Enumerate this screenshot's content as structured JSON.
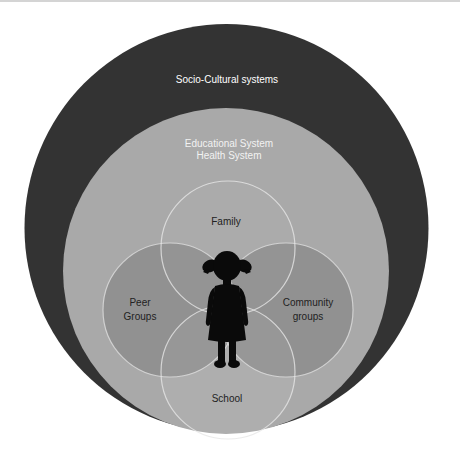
{
  "diagram": {
    "layers": {
      "outer": {
        "label": "Socio-Cultural systems",
        "color": "#333333",
        "text_color": "#ffffff"
      },
      "middle": {
        "line1": "Educational System",
        "line2": "Health System",
        "color": "#a9a9a9",
        "text_color": "#f2f2f2"
      }
    },
    "inner_circles": [
      {
        "id": "family",
        "label": "Family"
      },
      {
        "id": "peer",
        "line1": "Peer",
        "line2": "Groups"
      },
      {
        "id": "community",
        "line1": "Community",
        "line2": "groups"
      },
      {
        "id": "school",
        "label": "School"
      }
    ],
    "center": {
      "icon": "girl-silhouette-icon"
    },
    "colors": {
      "stroke": "#e6e6e6",
      "inner_text": "#222222",
      "silhouette": "#0a0a0a"
    }
  }
}
